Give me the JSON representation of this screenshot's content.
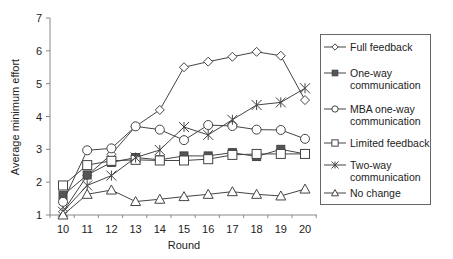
{
  "chart_data": {
    "type": "line",
    "title": "",
    "xlabel": "Round",
    "ylabel": "Average minimum effort",
    "x": [
      10,
      11,
      12,
      13,
      14,
      15,
      16,
      17,
      18,
      19,
      20
    ],
    "xlim": [
      10,
      20
    ],
    "ylim": [
      1,
      7
    ],
    "yticks": [
      1,
      2,
      3,
      4,
      5,
      6,
      7
    ],
    "grid": false,
    "legend_position": "right",
    "series": [
      {
        "name": "Full feedback",
        "marker": "diamond-open",
        "values": [
          1.1,
          2.2,
          2.85,
          3.7,
          4.2,
          5.5,
          5.67,
          5.82,
          5.97,
          5.85,
          4.5
        ]
      },
      {
        "name": "One-way communication",
        "marker": "square-filled",
        "values": [
          1.6,
          2.22,
          2.6,
          2.75,
          2.68,
          2.8,
          2.8,
          2.9,
          2.78,
          3.0,
          2.86
        ]
      },
      {
        "name": "MBA one-way communication",
        "marker": "circle-open",
        "values": [
          1.4,
          2.97,
          3.03,
          3.7,
          3.6,
          3.28,
          3.74,
          3.71,
          3.6,
          3.59,
          3.32
        ]
      },
      {
        "name": "Limited feedback",
        "marker": "square-open",
        "values": [
          1.9,
          2.52,
          2.65,
          2.68,
          2.66,
          2.66,
          2.7,
          2.83,
          2.86,
          2.86,
          2.86
        ]
      },
      {
        "name": "Two-way communication",
        "marker": "asterisk",
        "values": [
          1.1,
          1.9,
          2.2,
          2.75,
          2.98,
          3.68,
          3.44,
          3.9,
          4.35,
          4.43,
          4.86
        ]
      },
      {
        "name": "No change",
        "marker": "triangle-open",
        "values": [
          1.0,
          1.63,
          1.76,
          1.41,
          1.48,
          1.56,
          1.63,
          1.71,
          1.63,
          1.58,
          1.79
        ]
      }
    ]
  },
  "legend": {
    "items": [
      {
        "label": "Full feedback",
        "marker": "diamond-open"
      },
      {
        "label": "One-way\ncommunication",
        "marker": "square-filled"
      },
      {
        "label": "MBA one-way\ncommunication",
        "marker": "circle-open"
      },
      {
        "label": "Limited feedback",
        "marker": "square-open"
      },
      {
        "label": "Two-way\ncommunication",
        "marker": "asterisk"
      },
      {
        "label": "No change",
        "marker": "triangle-open"
      }
    ]
  },
  "colors": {
    "line": "#444444",
    "marker_fill": "#555555",
    "axis": "#888888"
  }
}
